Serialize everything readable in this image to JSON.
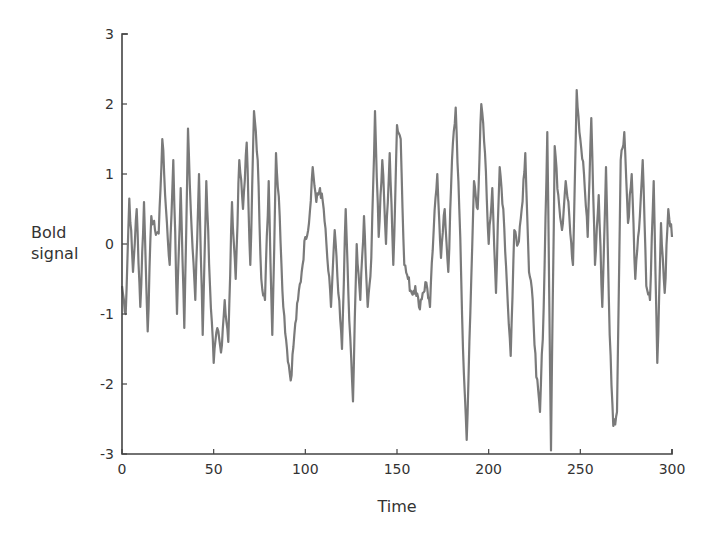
{
  "chart_data": {
    "type": "line",
    "title": "",
    "xlabel": "Time",
    "ylabel": "Bold signal",
    "xlim": [
      0,
      300
    ],
    "ylim": [
      -3,
      3
    ],
    "xticks": [
      0,
      50,
      100,
      150,
      200,
      250,
      300
    ],
    "yticks": [
      -3,
      -2,
      -1,
      0,
      1,
      2,
      3
    ],
    "grid": false,
    "legend": null,
    "line_color": "#7a7a7a",
    "series": [
      {
        "name": "Bold signal",
        "key_points": [
          [
            0,
            -0.6
          ],
          [
            2,
            -1.0
          ],
          [
            4,
            0.65
          ],
          [
            6,
            -0.4
          ],
          [
            8,
            0.5
          ],
          [
            10,
            -0.9
          ],
          [
            12,
            0.6
          ],
          [
            14,
            -1.25
          ],
          [
            16,
            0.4
          ],
          [
            18,
            0.2
          ],
          [
            20,
            0.15
          ],
          [
            22,
            1.5
          ],
          [
            24,
            0.5
          ],
          [
            26,
            -0.3
          ],
          [
            28,
            1.2
          ],
          [
            30,
            -1.0
          ],
          [
            32,
            0.8
          ],
          [
            34,
            -1.2
          ],
          [
            36,
            1.65
          ],
          [
            38,
            0.2
          ],
          [
            40,
            -0.8
          ],
          [
            42,
            1.0
          ],
          [
            44,
            -1.3
          ],
          [
            46,
            0.9
          ],
          [
            48,
            -0.6
          ],
          [
            50,
            -1.7
          ],
          [
            52,
            -1.2
          ],
          [
            54,
            -1.55
          ],
          [
            56,
            -0.8
          ],
          [
            58,
            -1.4
          ],
          [
            60,
            0.6
          ],
          [
            62,
            -0.5
          ],
          [
            64,
            1.2
          ],
          [
            66,
            0.5
          ],
          [
            68,
            1.45
          ],
          [
            70,
            -0.3
          ],
          [
            72,
            1.9
          ],
          [
            74,
            1.2
          ],
          [
            76,
            -0.5
          ],
          [
            78,
            -0.8
          ],
          [
            80,
            0.9
          ],
          [
            82,
            -1.3
          ],
          [
            84,
            1.3
          ],
          [
            86,
            0.4
          ],
          [
            88,
            -0.9
          ],
          [
            90,
            -1.5
          ],
          [
            92,
            -1.95
          ],
          [
            94,
            -1.3
          ],
          [
            96,
            -0.8
          ],
          [
            98,
            -0.4
          ],
          [
            100,
            0.1
          ],
          [
            102,
            0.3
          ],
          [
            104,
            1.1
          ],
          [
            106,
            0.6
          ],
          [
            108,
            0.8
          ],
          [
            110,
            0.5
          ],
          [
            112,
            -0.2
          ],
          [
            114,
            -0.9
          ],
          [
            116,
            0.2
          ],
          [
            118,
            -0.7
          ],
          [
            120,
            -1.5
          ],
          [
            122,
            0.5
          ],
          [
            124,
            -1.1
          ],
          [
            126,
            -2.25
          ],
          [
            128,
            0.0
          ],
          [
            130,
            -0.8
          ],
          [
            132,
            0.4
          ],
          [
            134,
            -0.9
          ],
          [
            136,
            -0.2
          ],
          [
            138,
            1.9
          ],
          [
            140,
            0.1
          ],
          [
            142,
            1.2
          ],
          [
            144,
            0.0
          ],
          [
            146,
            1.3
          ],
          [
            148,
            -0.3
          ],
          [
            150,
            1.7
          ],
          [
            152,
            1.5
          ],
          [
            154,
            -0.3
          ],
          [
            156,
            -0.5
          ],
          [
            158,
            -0.7
          ],
          [
            160,
            -0.6
          ],
          [
            162,
            -0.9
          ],
          [
            164,
            -0.7
          ],
          [
            166,
            -0.55
          ],
          [
            168,
            -0.9
          ],
          [
            170,
            0.2
          ],
          [
            172,
            1.0
          ],
          [
            174,
            -0.2
          ],
          [
            176,
            0.5
          ],
          [
            178,
            -0.4
          ],
          [
            180,
            1.2
          ],
          [
            182,
            1.95
          ],
          [
            184,
            0.5
          ],
          [
            186,
            -1.5
          ],
          [
            188,
            -2.8
          ],
          [
            190,
            -1.0
          ],
          [
            192,
            0.9
          ],
          [
            194,
            0.5
          ],
          [
            196,
            2.0
          ],
          [
            198,
            1.3
          ],
          [
            200,
            0.0
          ],
          [
            202,
            0.8
          ],
          [
            204,
            -0.7
          ],
          [
            206,
            1.1
          ],
          [
            208,
            0.5
          ],
          [
            210,
            -0.6
          ],
          [
            212,
            -1.6
          ],
          [
            214,
            0.2
          ],
          [
            216,
            0.0
          ],
          [
            218,
            0.5
          ],
          [
            220,
            1.3
          ],
          [
            222,
            -0.4
          ],
          [
            224,
            -0.8
          ],
          [
            226,
            -1.9
          ],
          [
            228,
            -2.4
          ],
          [
            230,
            -0.9
          ],
          [
            232,
            1.6
          ],
          [
            234,
            -2.95
          ],
          [
            236,
            1.4
          ],
          [
            238,
            0.7
          ],
          [
            240,
            0.2
          ],
          [
            242,
            0.9
          ],
          [
            244,
            0.4
          ],
          [
            246,
            -0.3
          ],
          [
            248,
            2.2
          ],
          [
            250,
            1.5
          ],
          [
            252,
            1.0
          ],
          [
            254,
            0.1
          ],
          [
            256,
            1.8
          ],
          [
            258,
            -0.3
          ],
          [
            260,
            0.7
          ],
          [
            262,
            -0.9
          ],
          [
            264,
            1.1
          ],
          [
            266,
            -1.3
          ],
          [
            268,
            -2.6
          ],
          [
            270,
            -2.4
          ],
          [
            272,
            1.2
          ],
          [
            274,
            1.6
          ],
          [
            276,
            0.3
          ],
          [
            278,
            1.0
          ],
          [
            280,
            -0.5
          ],
          [
            282,
            0.2
          ],
          [
            284,
            1.2
          ],
          [
            286,
            -0.6
          ],
          [
            288,
            -0.8
          ],
          [
            290,
            0.9
          ],
          [
            292,
            -1.7
          ],
          [
            294,
            0.3
          ],
          [
            296,
            -0.7
          ],
          [
            298,
            0.5
          ],
          [
            300,
            0.1
          ]
        ]
      }
    ]
  }
}
